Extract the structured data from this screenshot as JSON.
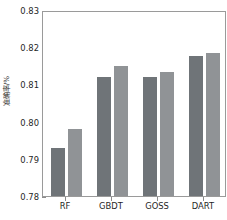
{
  "chart_data": {
    "type": "bar",
    "title": "",
    "xlabel": "",
    "ylabel": "准确率/%",
    "categories": [
      "RF",
      "GBDT",
      "GOSS",
      "DART"
    ],
    "series": [
      {
        "name": "series-1",
        "color": "#6f7478",
        "values": [
          0.793,
          0.812,
          0.812,
          0.8176
        ]
      },
      {
        "name": "series-2",
        "color": "#909396",
        "values": [
          0.798,
          0.815,
          0.8134,
          0.8185
        ]
      }
    ],
    "ylim": [
      0.78,
      0.83
    ],
    "yticks": [
      0.78,
      0.79,
      0.8,
      0.81,
      0.82,
      0.83
    ],
    "ytick_labels": [
      "0.78",
      "0.79",
      "0.80",
      "0.81",
      "0.82",
      "0.83"
    ],
    "grid": false,
    "legend": "none"
  },
  "figure": {
    "background_color": "#ffffff",
    "axis_color": "#9a9a9a",
    "text_color": "#1f1f1f"
  }
}
